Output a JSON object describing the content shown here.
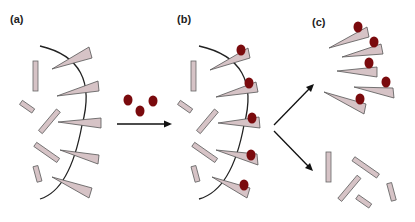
{
  "figure": {
    "panels": [
      {
        "id": "a",
        "label": "(a)",
        "description": "Wedges (receptors) embedded in curved membrane with free rods"
      },
      {
        "id": "b",
        "label": "(b)",
        "description": "Ligand particles bound to tips of membrane-embedded wedges"
      },
      {
        "id": "c",
        "label": "(c)",
        "description": "Separated: ligand-bound wedges (top) and free rods (bottom)"
      }
    ],
    "colors": {
      "wedge_fill": "#d6c3c6",
      "ligand": "#7a0a0d",
      "membrane": "#222222",
      "arrow": "#111111"
    },
    "free_ligand_count": 3,
    "wedge_count_per_panel": 5,
    "rod_count_per_panel": 5
  }
}
